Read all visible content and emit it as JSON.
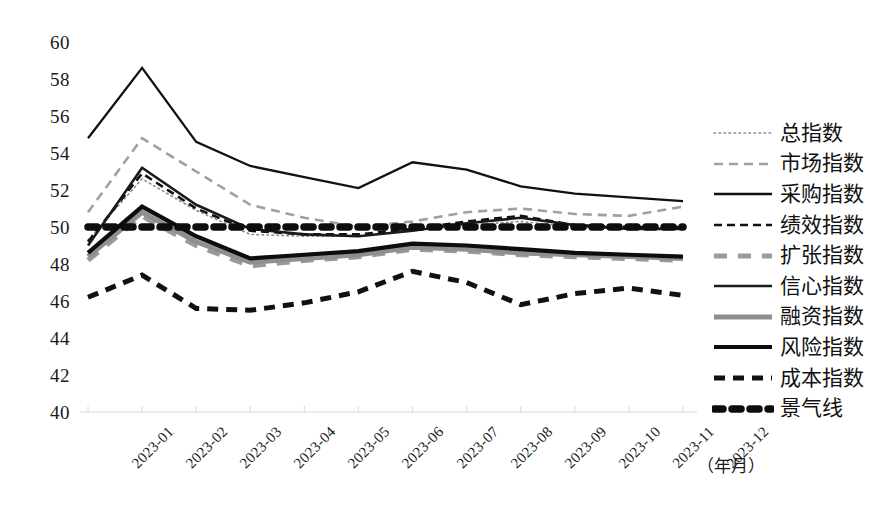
{
  "chart_data": {
    "type": "line",
    "title": "",
    "subtitle": "",
    "xlabel": "（年月）",
    "ylabel": "",
    "grid": false,
    "legend_position": "right",
    "ylim": [
      40,
      60
    ],
    "yticks": [
      60,
      58,
      56,
      54,
      52,
      50,
      48,
      46,
      44,
      42,
      40
    ],
    "categories": [
      "2023-01",
      "2023-02",
      "2023-03",
      "2023-04",
      "2023-05",
      "2023-06",
      "2023-07",
      "2023-08",
      "2023-09",
      "2023-10",
      "2023-11",
      "2023-12"
    ],
    "series": [
      {
        "name": "总指数",
        "style": "dotted-thin",
        "color": "#8c8c8c",
        "values": [
          49.3,
          52.6,
          50.9,
          49.6,
          49.5,
          49.5,
          49.8,
          50.1,
          50.3,
          50.0,
          49.9,
          49.9
        ]
      },
      {
        "name": "市场指数",
        "style": "dashed-gray",
        "color": "#a0a0a0",
        "values": [
          50.8,
          54.8,
          53.0,
          51.2,
          50.5,
          50.0,
          50.3,
          50.8,
          51.0,
          50.7,
          50.6,
          51.1
        ]
      },
      {
        "name": "采购指数",
        "style": "solid-thin",
        "color": "#111111",
        "values": [
          54.8,
          58.6,
          54.6,
          53.3,
          52.7,
          52.1,
          53.5,
          53.1,
          52.2,
          51.8,
          51.6,
          51.4
        ]
      },
      {
        "name": "绩效指数",
        "style": "dashed-black",
        "color": "#111111",
        "values": [
          49.2,
          52.9,
          51.0,
          49.8,
          49.6,
          49.6,
          49.9,
          50.3,
          50.6,
          50.1,
          50.0,
          50.0
        ]
      },
      {
        "name": "扩张指数",
        "style": "dashed-thick-gray",
        "color": "#9a9a9a",
        "values": [
          48.2,
          50.6,
          49.0,
          47.9,
          48.2,
          48.4,
          48.8,
          48.7,
          48.5,
          48.4,
          48.3,
          48.2
        ]
      },
      {
        "name": "信心指数",
        "style": "solid-medium",
        "color": "#1a1a1a",
        "values": [
          49.0,
          53.2,
          51.2,
          49.9,
          49.6,
          49.5,
          49.8,
          50.2,
          50.5,
          50.1,
          49.9,
          49.9
        ]
      },
      {
        "name": "融资指数",
        "style": "solid-thick-gray",
        "color": "#8f8f8f",
        "values": [
          48.4,
          50.8,
          49.2,
          48.1,
          48.3,
          48.5,
          48.9,
          48.8,
          48.6,
          48.5,
          48.4,
          48.3
        ]
      },
      {
        "name": "风险指数",
        "style": "solid-thick-black",
        "color": "#0d0d0d",
        "values": [
          48.6,
          51.1,
          49.5,
          48.3,
          48.5,
          48.7,
          49.1,
          49.0,
          48.8,
          48.6,
          48.5,
          48.4
        ]
      },
      {
        "name": "成本指数",
        "style": "dashed-thick-black",
        "color": "#111111",
        "values": [
          46.2,
          47.4,
          45.6,
          45.5,
          45.9,
          46.5,
          47.6,
          47.0,
          45.8,
          46.4,
          46.7,
          46.3
        ]
      },
      {
        "name": "景气线",
        "style": "dotted-heavy",
        "color": "#0d0d0d",
        "values": [
          50,
          50,
          50,
          50,
          50,
          50,
          50,
          50,
          50,
          50,
          50,
          50
        ]
      }
    ]
  },
  "axis": {
    "unit_label": "（年月）"
  }
}
